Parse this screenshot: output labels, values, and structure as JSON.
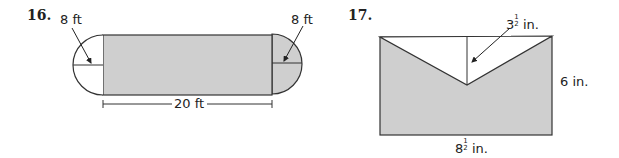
{
  "problems": [
    {
      "number": "16.",
      "figure": {
        "shape": "rectangle with semicircular ends",
        "left_semicircle_label": "8 ft",
        "right_semicircle_label": "8 ft",
        "length_label": "20 ft",
        "shaded": "rectangle and right semicircle"
      }
    },
    {
      "number": "17.",
      "figure": {
        "shape": "rectangle with V-shaped triangle cut from top",
        "height_label_whole": "3",
        "height_label_num": "1",
        "height_label_den": "2",
        "height_label_unit": "in.",
        "side_label": "6 in.",
        "base_label_whole": "8",
        "base_label_num": "1",
        "base_label_den": "2",
        "base_label_unit": "in."
      }
    }
  ],
  "colors": {
    "shade": "#cfcfcf",
    "stroke": "#333333"
  }
}
